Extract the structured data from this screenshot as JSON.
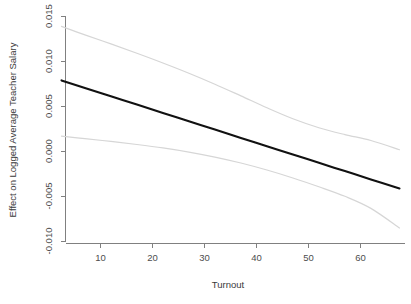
{
  "chart_data": {
    "type": "line",
    "title": "",
    "xlabel": "Turnout",
    "ylabel": "Effect on Logged Average Teacher Salary",
    "xlim": [
      2.5,
      67.5
    ],
    "ylim": [
      -0.0105,
      0.0155
    ],
    "grid": false,
    "legend": "none",
    "xticks": [
      10,
      20,
      30,
      40,
      50,
      60
    ],
    "xtick_labels": [
      "10",
      "20",
      "30",
      "40",
      "50",
      "60"
    ],
    "yticks": [
      0.015,
      0.01,
      0.005,
      0.0,
      -0.005,
      -0.01
    ],
    "ytick_labels": [
      "0.015",
      "0.010",
      "0.005",
      "0.000",
      "-0.005",
      "-0.010"
    ],
    "x": [
      2.5,
      7,
      12,
      17,
      22,
      27,
      32,
      37,
      42,
      47,
      52,
      57,
      62,
      67.5
    ],
    "series": [
      {
        "name": "Marginal effect (fit)",
        "role": "fit",
        "color": "#111111",
        "values": [
          0.0079,
          0.00705,
          0.00613,
          0.00521,
          0.00428,
          0.00336,
          0.00244,
          0.00151,
          0.00059,
          -0.00033,
          -0.00126,
          -0.00218,
          -0.0031,
          -0.0041
        ]
      },
      {
        "name": "Upper 95% confidence bound",
        "role": "ci-upper",
        "color": "#d6d6d6",
        "values": [
          0.0139,
          0.01296,
          0.01196,
          0.01092,
          0.00984,
          0.0087,
          0.00748,
          0.00618,
          0.00486,
          0.00364,
          0.00264,
          0.00188,
          0.00122,
          0.0002
        ]
      },
      {
        "name": "Lower 95% confidence bound",
        "role": "ci-lower",
        "color": "#d6d6d6",
        "values": [
          0.0017,
          0.00142,
          0.00112,
          0.00078,
          0.0004,
          -6e-05,
          -0.00062,
          -0.00128,
          -0.00206,
          -0.00294,
          -0.00392,
          -0.00498,
          -0.00632,
          -0.0085
        ]
      }
    ]
  },
  "axes": {
    "x_axis_name": "Turnout",
    "y_axis_name": "Effect on Logged Average Teacher Salary"
  }
}
